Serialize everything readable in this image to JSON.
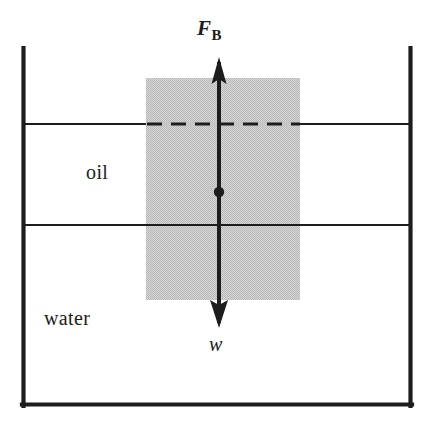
{
  "figure": {
    "background_color": "#ffffff",
    "ink_color": "#1d1d1d",
    "block_fill_color": "#c9c9c9"
  },
  "labels": {
    "oil": "oil",
    "water": "water",
    "buoyant_force": "F",
    "buoyant_force_subscript": "B",
    "weight": "w"
  },
  "container": {
    "name": "open-tank",
    "left_x": 22,
    "right_x": 411,
    "top_y": 48,
    "bottom_y": 406,
    "wall_thickness": 4
  },
  "levels": {
    "oil_surface_y": 124,
    "oil_water_interface_y": 225
  },
  "block": {
    "left_x": 146,
    "right_x": 300,
    "top_y": 78,
    "bottom_y": 300
  },
  "force_arrows": {
    "axis_x": 219,
    "up_tip_y": 58,
    "down_tip_y": 327,
    "centroid_dot_y": 192,
    "centroid_dot_radius": 5,
    "shaft_width": 4
  }
}
